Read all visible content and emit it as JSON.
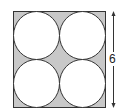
{
  "diagram": {
    "side_length_label": "6",
    "colors": {
      "shaded": "#c8c8c8",
      "circle_fill": "#ffffff",
      "stroke": "#333333"
    },
    "circles": [
      {
        "position": "top-left"
      },
      {
        "position": "top-right"
      },
      {
        "position": "bottom-left"
      },
      {
        "position": "bottom-right"
      }
    ]
  }
}
